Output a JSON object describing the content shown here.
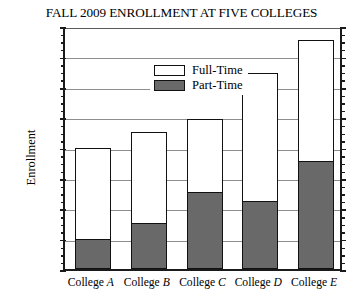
{
  "chart_data": {
    "type": "bar",
    "subtype": "stacked-vertical",
    "title": "FALL 2009 ENROLLMENT AT FIVE COLLEGES",
    "xlabel": "",
    "ylabel": "Enrollment",
    "categories": [
      "College A",
      "College B",
      "College C",
      "College D",
      "College E"
    ],
    "category_prefix": "College",
    "category_letters": [
      "A",
      "B",
      "C",
      "D",
      "E"
    ],
    "series": [
      {
        "name": "Part-Time",
        "color": "#696969",
        "values": [
          1000,
          1500,
          2550,
          2250,
          3550
        ]
      },
      {
        "name": "Full-Time",
        "color": "#ffffff",
        "values": [
          3000,
          3000,
          2400,
          4200,
          4000
        ]
      }
    ],
    "totals": [
      4000,
      4500,
      4950,
      6450,
      7550
    ],
    "stack_order_bottom_to_top": [
      "Part-Time",
      "Full-Time"
    ],
    "ylim": [
      0,
      8000
    ],
    "ytick_values": [
      0,
      1000,
      2000,
      3000,
      4000,
      5000,
      6000,
      7000,
      8000
    ],
    "ytick_labels": [
      "0",
      "1,000",
      "2,000",
      "3,000",
      "4,000",
      "5,000",
      "6,000",
      "7,000",
      "8,000"
    ],
    "yminor_interval": 250,
    "grid": true,
    "grid_axis": "y",
    "legend_position": "top-left-inside",
    "legend_entries": [
      "Full-Time",
      "Part-Time"
    ]
  },
  "axis": {
    "y_label": "Enrollment"
  },
  "legend": {
    "full_time": "Full-Time",
    "part_time": "Part-Time"
  }
}
